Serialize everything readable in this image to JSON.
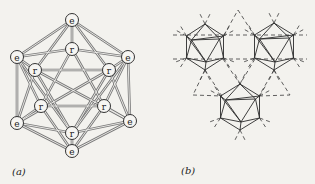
{
  "figure": {
    "panel_a": {
      "label": "(a)",
      "description": "Icosahedral cluster with labeled vertices",
      "vertex_labels": {
        "outer": "e",
        "inner": "r"
      },
      "nodes": [
        {
          "id": "e1",
          "label": "e"
        },
        {
          "id": "e2",
          "label": "e"
        },
        {
          "id": "e3",
          "label": "e"
        },
        {
          "id": "e4",
          "label": "e"
        },
        {
          "id": "e5",
          "label": "e"
        },
        {
          "id": "e6",
          "label": "e"
        },
        {
          "id": "r1",
          "label": "r"
        },
        {
          "id": "r2",
          "label": "r"
        },
        {
          "id": "r3",
          "label": "r"
        },
        {
          "id": "r4",
          "label": "r"
        },
        {
          "id": "r5",
          "label": "r"
        },
        {
          "id": "r6",
          "label": "r"
        }
      ]
    },
    "panel_b": {
      "label": "(b)",
      "description": "Three icosahedra linked by dashed triangular network",
      "icosahedra_count": 3
    }
  }
}
